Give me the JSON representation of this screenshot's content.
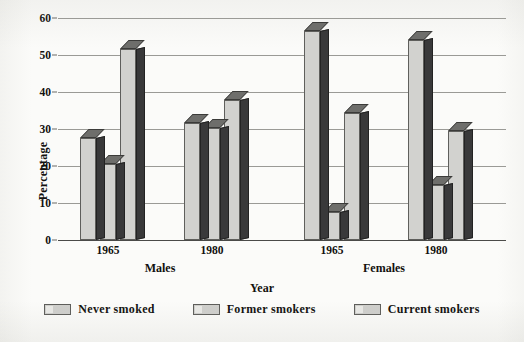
{
  "chart_data": {
    "type": "bar",
    "title": "",
    "subtitle": "",
    "xlabel": "Year",
    "ylabel": "Percentage",
    "ylim": [
      0,
      60
    ],
    "ytick_step": 10,
    "yticks": [
      0,
      10,
      20,
      30,
      40,
      50,
      60
    ],
    "grid": true,
    "legend_position": "bottom",
    "style": "3d-grouped-bars",
    "group_labels": [
      "Males",
      "Females"
    ],
    "categories": [
      "1965",
      "1980",
      "1965",
      "1980"
    ],
    "group_of_category": [
      "Males",
      "Males",
      "Females",
      "Females"
    ],
    "series": [
      {
        "name": "Never smoked",
        "values": [
          27.5,
          31.5,
          56.5,
          54.0
        ]
      },
      {
        "name": "Former smokers",
        "values": [
          20.5,
          30.4,
          7.6,
          14.8
        ]
      },
      {
        "name": "Current smokers",
        "values": [
          51.6,
          37.8,
          34.2,
          29.5
        ]
      }
    ],
    "annotations": []
  },
  "axes": {
    "y_title": "Percentage",
    "x_title": "Year",
    "y_tick_labels": [
      "60",
      "50",
      "40",
      "30",
      "20",
      "10",
      "0"
    ]
  },
  "x_axis": {
    "ticks": [
      {
        "label": "1965",
        "group": "Males"
      },
      {
        "label": "1980",
        "group": "Males"
      },
      {
        "label": "1965",
        "group": "Females"
      },
      {
        "label": "1980",
        "group": "Females"
      }
    ],
    "groups": [
      {
        "label": "Males"
      },
      {
        "label": "Females"
      }
    ]
  },
  "legend": {
    "items": [
      {
        "label": "Never smoked"
      },
      {
        "label": "Former smokers"
      },
      {
        "label": "Current smokers"
      }
    ]
  },
  "colors": {
    "bar_front": "#d2d2cf",
    "bar_side": "#39393a",
    "bar_top": "#6e6e6b",
    "bar_outline": "#5f5f5c",
    "gridline": "#9a9a96",
    "axis": "#4a4a48",
    "text": "#12110f",
    "background": "#fbfbf9"
  }
}
